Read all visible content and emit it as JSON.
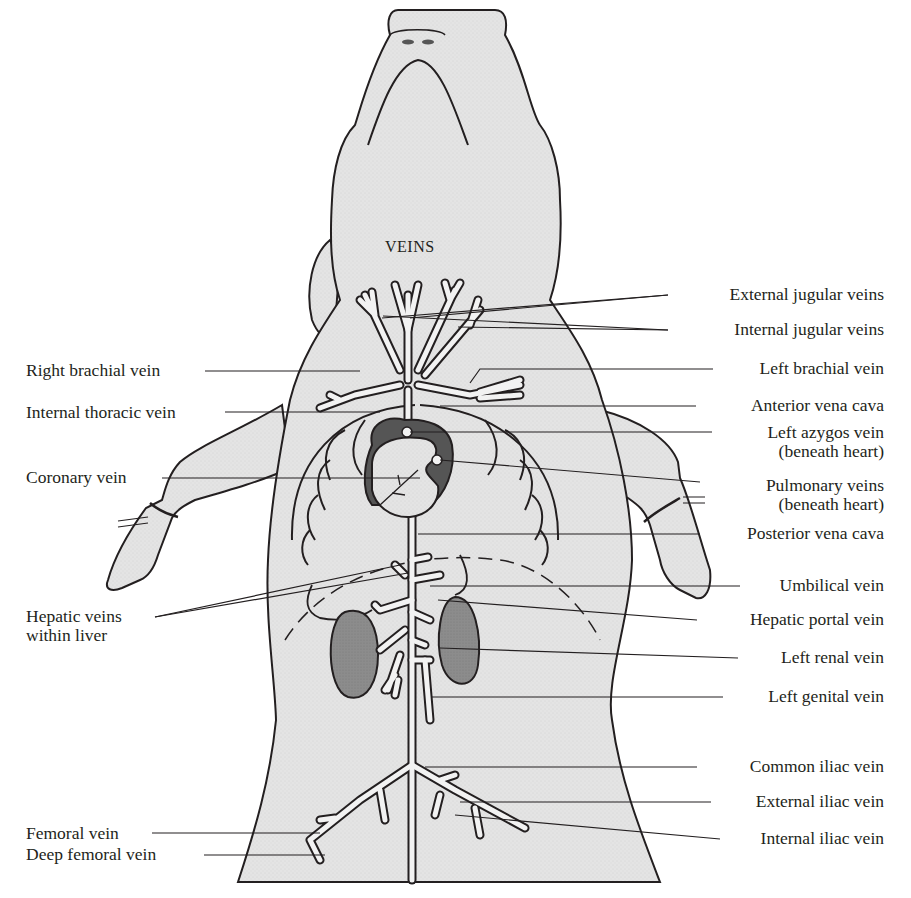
{
  "diagram": {
    "title": "VEINS",
    "colors": {
      "body_fill": "#e6e6e6",
      "outline": "#231f20",
      "organ_dark": "#8a8a8a",
      "heart_dark": "#555555",
      "vein_fill": "#f2f2f2",
      "background": "#ffffff",
      "text": "#231f20"
    }
  },
  "labels_left": [
    {
      "id": "right-brachial-vein",
      "text": "Right brachial vein"
    },
    {
      "id": "internal-thoracic-vein",
      "text": "Internal thoracic vein"
    },
    {
      "id": "coronary-vein",
      "text": "Coronary vein"
    },
    {
      "id": "hepatic-veins",
      "line1": "Hepatic veins",
      "line2": "within liver"
    },
    {
      "id": "femoral-vein",
      "text": "Femoral vein"
    },
    {
      "id": "deep-femoral-vein",
      "text": "Deep femoral vein"
    }
  ],
  "labels_right": [
    {
      "id": "external-jugular-veins",
      "text": "External jugular veins"
    },
    {
      "id": "internal-jugular-veins",
      "text": "Internal jugular veins"
    },
    {
      "id": "left-brachial-vein",
      "text": "Left brachial vein"
    },
    {
      "id": "anterior-vena-cava",
      "text": "Anterior vena cava"
    },
    {
      "id": "left-azygos-vein",
      "line1": "Left azygos vein",
      "line2": "(beneath heart)"
    },
    {
      "id": "pulmonary-veins",
      "line1": "Pulmonary veins",
      "line2": "(beneath heart)"
    },
    {
      "id": "posterior-vena-cava",
      "text": "Posterior vena cava"
    },
    {
      "id": "umbilical-vein",
      "text": "Umbilical vein"
    },
    {
      "id": "hepatic-portal-vein",
      "text": "Hepatic portal vein"
    },
    {
      "id": "left-renal-vein",
      "text": "Left renal vein"
    },
    {
      "id": "left-genital-vein",
      "text": "Left genital vein"
    },
    {
      "id": "common-iliac-vein",
      "text": "Common iliac vein"
    },
    {
      "id": "external-iliac-vein",
      "text": "External iliac vein"
    },
    {
      "id": "internal-iliac-vein",
      "text": "Internal iliac vein"
    }
  ]
}
